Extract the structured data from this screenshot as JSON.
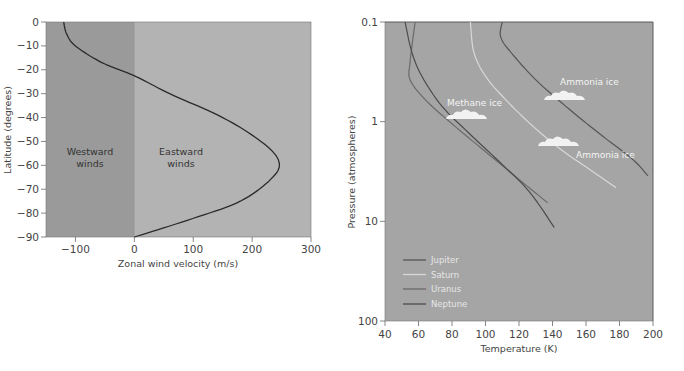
{
  "chart_data": [
    {
      "type": "line",
      "title": "",
      "xlabel": "Zonal wind velocity (m/s)",
      "ylabel": "Latitude (degrees)",
      "xlim": [
        -150,
        300
      ],
      "ylim": [
        -90,
        0
      ],
      "x_ticks": [
        "−100",
        "0",
        "100",
        "200",
        "300"
      ],
      "y_ticks": [
        "0",
        "−10",
        "−20",
        "−30",
        "−40",
        "−50",
        "−60",
        "−70",
        "−80",
        "−90"
      ],
      "grid": false,
      "regions": [
        {
          "label_line1": "Westward",
          "label_line2": "winds",
          "x_range": [
            -150,
            0
          ],
          "color": "#9a9a9a"
        },
        {
          "label_line1": "Eastward",
          "label_line2": "winds",
          "x_range": [
            0,
            300
          ],
          "color": "#b3b3b3"
        }
      ],
      "series": [
        {
          "name": "Zonal wind profile",
          "color": "#2a2a2a",
          "points": [
            [
              -120,
              0
            ],
            [
              -115,
              -5
            ],
            [
              -100,
              -10
            ],
            [
              -55,
              -17
            ],
            [
              0,
              -22.5
            ],
            [
              60,
              -30
            ],
            [
              150,
              -40
            ],
            [
              215,
              -50
            ],
            [
              245,
              -58
            ],
            [
              235,
              -65
            ],
            [
              180,
              -75
            ],
            [
              90,
              -83
            ],
            [
              0,
              -90
            ]
          ]
        }
      ]
    },
    {
      "type": "line",
      "title": "",
      "xlabel": "Temperature (K)",
      "ylabel": "Pressure (atmospheres)",
      "xlim": [
        40,
        200
      ],
      "ylim": [
        100,
        0.1
      ],
      "y_scale": "log",
      "y_inverted": true,
      "x_ticks": [
        "40",
        "60",
        "80",
        "100",
        "120",
        "140",
        "160",
        "180",
        "200"
      ],
      "y_ticks": [
        "0.1",
        "1",
        "10",
        "100"
      ],
      "grid": false,
      "legend_position": "lower left",
      "background": "#a5a5a5",
      "series": [
        {
          "name": "Jupiter",
          "color": "#555555",
          "points": [
            [
              110,
              0.1
            ],
            [
              109,
              0.14
            ],
            [
              115,
              0.2
            ],
            [
              130,
              0.38
            ],
            [
              150,
              0.75
            ],
            [
              170,
              1.4
            ],
            [
              188,
              2.4
            ],
            [
              197,
              3.5
            ]
          ]
        },
        {
          "name": "Saturn",
          "color": "#d8d8d8",
          "points": [
            [
              91,
              0.1
            ],
            [
              93,
              0.2
            ],
            [
              100,
              0.35
            ],
            [
              112,
              0.6
            ],
            [
              128,
              1.1
            ],
            [
              145,
              1.9
            ],
            [
              162,
              3.0
            ],
            [
              178,
              4.6
            ]
          ]
        },
        {
          "name": "Uranus",
          "color": "#6a6a6a",
          "points": [
            [
              58,
              0.1
            ],
            [
              55,
              0.25
            ],
            [
              55,
              0.38
            ],
            [
              64,
              0.6
            ],
            [
              80,
              1.05
            ],
            [
              100,
              2.0
            ],
            [
              120,
              3.8
            ],
            [
              137,
              6.5
            ]
          ]
        },
        {
          "name": "Neptune",
          "color": "#4c4c4c",
          "points": [
            [
              52,
              0.1
            ],
            [
              56,
              0.2
            ],
            [
              62,
              0.35
            ],
            [
              74,
              0.7
            ],
            [
              90,
              1.3
            ],
            [
              108,
              2.5
            ],
            [
              126,
              5.0
            ],
            [
              141,
              11.5
            ]
          ]
        }
      ],
      "annotations": [
        {
          "text": "Methane ice",
          "near": [
            74,
            0.75
          ]
        },
        {
          "text": "Ammonia ice",
          "near": [
            150,
            0.45
          ]
        },
        {
          "text": "Ammonia ice",
          "near": [
            160,
            2.4
          ]
        }
      ]
    }
  ]
}
